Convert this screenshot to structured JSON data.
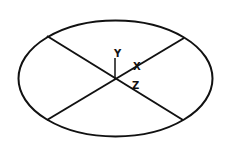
{
  "diagram": {
    "type": "ellipse-with-crossed-axes",
    "stroke_color": "#111111",
    "background": "#ffffff",
    "ellipse": {
      "cx": 115.5,
      "cy": 78.5,
      "rx": 97,
      "ry": 58
    },
    "lines": [
      {
        "x1": 47,
        "y1": 36,
        "x2": 183,
        "y2": 120
      },
      {
        "x1": 47,
        "y1": 120,
        "x2": 184,
        "y2": 38
      }
    ],
    "y_axis": {
      "x1": 115,
      "y1": 79,
      "x2": 115,
      "y2": 58
    },
    "labels": {
      "y": "Y",
      "x": "X",
      "z": "Z"
    }
  }
}
